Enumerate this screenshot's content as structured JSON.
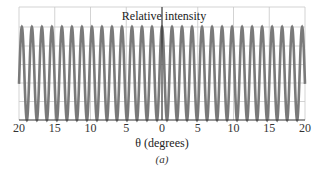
{
  "chart_data": {
    "type": "line",
    "title": "",
    "ylabel": "Relative intensity",
    "xlabel": "θ (degrees)",
    "caption": "(a)",
    "xlim": [
      -20,
      20
    ],
    "ylim": [
      0,
      1.2
    ],
    "x_tick_values": [
      -20,
      -15,
      -10,
      -5,
      0,
      5,
      10,
      15,
      20
    ],
    "x_tick_labels": [
      "20",
      "15",
      "10",
      "5",
      "0",
      "5",
      "10",
      "15",
      "20"
    ],
    "grid": true,
    "legend": null,
    "series": [
      {
        "name": "Relative intensity (two-slit interference, cos² fringes)",
        "function": "I = cos^2(pi * theta / fringe_spacing)",
        "fringe_spacing_deg": 1.4,
        "peak_value": 1.0,
        "min_value": 0.0,
        "peak_count_visible": 29,
        "color": "#7a7a7a"
      }
    ]
  },
  "colors": {
    "curve": "#7a7a7a",
    "grid": "#c8c8c8",
    "axis": "#333333",
    "center_line": "#222222"
  }
}
